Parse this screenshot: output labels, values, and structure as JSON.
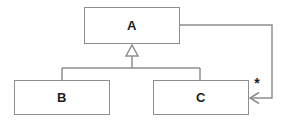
{
  "diagram": {
    "kind": "uml-class-diagram",
    "nodes": [
      {
        "id": "A",
        "label": "A"
      },
      {
        "id": "B",
        "label": "B"
      },
      {
        "id": "C",
        "label": "C"
      }
    ],
    "edges": [
      {
        "type": "generalization",
        "from": "B",
        "to": "A"
      },
      {
        "type": "generalization",
        "from": "C",
        "to": "A"
      },
      {
        "type": "association",
        "from": "A",
        "to": "C",
        "target_multiplicity": "*"
      }
    ],
    "multiplicity_label": "*",
    "colors": {
      "line": "#8e8e8e",
      "text": "#1c1c1c",
      "background": "#ffffff"
    }
  }
}
